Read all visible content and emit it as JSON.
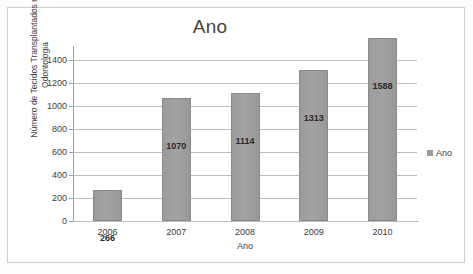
{
  "chart_data": {
    "type": "bar",
    "title": "Ano",
    "xlabel": "Ano",
    "ylabel": "Número de Tecidos Transplantados na Odontologia",
    "ylabel_lines": [
      "Número de Tecidos Transplantados na",
      "Odontologia"
    ],
    "categories": [
      "2006",
      "2007",
      "2008",
      "2009",
      "2010"
    ],
    "values": [
      266,
      1070,
      1114,
      1313,
      1588
    ],
    "data_labels": [
      "266",
      "1070",
      "1114",
      "1313",
      "1588"
    ],
    "series": [
      {
        "name": "Ano",
        "values": [
          266,
          1070,
          1114,
          1313,
          1588
        ]
      }
    ],
    "yticks": [
      0,
      200,
      400,
      600,
      800,
      1000,
      1200,
      1400
    ],
    "ytick_labels": [
      "0",
      "200",
      "400",
      "600",
      "800",
      "1000",
      "1200",
      "1400"
    ],
    "ylim": [
      0,
      1520
    ],
    "grid": true,
    "grid_axis": "y",
    "legend": {
      "position": "right",
      "entries": [
        "Ano"
      ]
    },
    "colors": {
      "bar_fill": "#9b9b9b",
      "bar_border": "#8a8a8a",
      "gridline": "#bdbdbd",
      "axis_line": "#9e9e9e",
      "text": "#3b3b3b",
      "title_text": "#444444",
      "frame_border": "#cfcfcf",
      "background": "#ffffff"
    }
  },
  "legend": {
    "label": "Ano",
    "marker": "square-marker"
  }
}
